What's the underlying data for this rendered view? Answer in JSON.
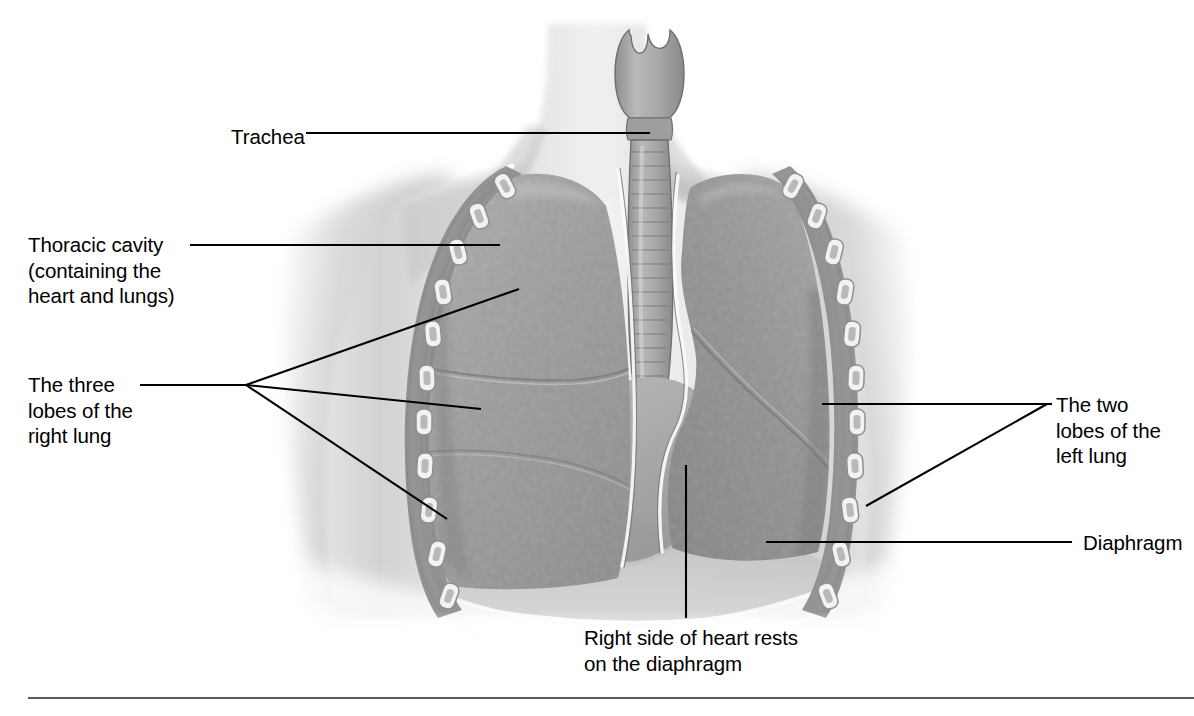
{
  "figure": {
    "background_color": "#ffffff",
    "ink_color": "#000000",
    "rule_color": "#5b5b5b"
  },
  "labels": {
    "trachea": "Trachea",
    "thoracic_cavity": "Thoracic cavity\n(containing the\nheart and lungs)",
    "right_lung_lobes": "The three\nlobes of the\nright lung",
    "left_lung_lobes": "The two\nlobes of the\nleft lung",
    "diaphragm": "Diaphragm",
    "heart_on_diaphragm": "Right side of heart rests\non the diaphragm"
  },
  "structures": [
    {
      "name": "larynx",
      "tone": "#9a9a9a"
    },
    {
      "name": "trachea",
      "tone": "#a6a6a6"
    },
    {
      "name": "right-lung-upper-lobe",
      "tone": "#9b9b9b"
    },
    {
      "name": "right-lung-middle-lobe",
      "tone": "#a2a2a2"
    },
    {
      "name": "right-lung-lower-lobe",
      "tone": "#989898"
    },
    {
      "name": "left-lung-upper-lobe",
      "tone": "#8f8f8f"
    },
    {
      "name": "left-lung-lower-lobe",
      "tone": "#939393"
    },
    {
      "name": "heart",
      "tone": "#a8a8a8"
    },
    {
      "name": "diaphragm",
      "tone": "#b4b4b4"
    },
    {
      "name": "pleural-membrane",
      "tone": "#f4f4f4"
    },
    {
      "name": "rib",
      "tone": "#efefef"
    },
    {
      "name": "intercostal-muscle",
      "tone": "#7c7c7c"
    },
    {
      "name": "torso-skin",
      "tone": "#d9d9d9"
    }
  ],
  "leader_lines": [
    {
      "name": "trachea-leader",
      "from": [
        306,
        133
      ],
      "to": [
        650,
        133
      ]
    },
    {
      "name": "thoracic-cavity-leader",
      "from": [
        190,
        245
      ],
      "to": [
        500,
        245
      ]
    },
    {
      "name": "right-lung-fan-origin",
      "at": [
        246,
        385
      ]
    },
    {
      "name": "right-upper-lobe-leader",
      "to": [
        519,
        289
      ]
    },
    {
      "name": "right-middle-lobe-leader",
      "to": [
        481,
        409
      ]
    },
    {
      "name": "right-lower-lobe-leader",
      "to": [
        447,
        519
      ]
    },
    {
      "name": "left-lung-fan-origin",
      "at": [
        1047,
        404
      ]
    },
    {
      "name": "left-upper-lobe-leader",
      "to": [
        822,
        404
      ]
    },
    {
      "name": "left-lower-lobe-leader",
      "to": [
        866,
        506
      ]
    },
    {
      "name": "diaphragm-leader",
      "from": [
        766,
        542
      ],
      "to": [
        1072,
        542
      ]
    },
    {
      "name": "heart-leader",
      "from": [
        686,
        465
      ],
      "to": [
        686,
        618
      ]
    }
  ]
}
